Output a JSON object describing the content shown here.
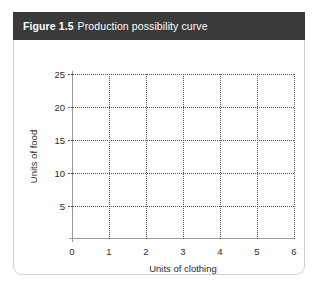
{
  "figure": {
    "caption_number": "Figure 1.5",
    "caption_text": "Production possibility curve",
    "header_color": "#3a3a3a",
    "header_text_color": "#ffffff",
    "card_border_color": "#d2d2d2"
  },
  "chart_data": {
    "type": "line",
    "title": "Production possibility curve",
    "xlabel": "Units of clothing",
    "ylabel": "Units of food",
    "xlim": [
      0,
      6
    ],
    "ylim": [
      0,
      25
    ],
    "x_ticks": [
      "0",
      "1",
      "2",
      "3",
      "4",
      "5",
      "6"
    ],
    "x_tick_values": [
      0,
      1,
      2,
      3,
      4,
      5,
      6
    ],
    "y_ticks": [
      "5",
      "10",
      "15",
      "20",
      "25"
    ],
    "y_tick_values": [
      5,
      10,
      15,
      20,
      25
    ],
    "grid": true,
    "grid_style": "dotted",
    "grid_color": "#555555",
    "axis_color": "#9a9a9a",
    "legend": null,
    "series": [],
    "annotations": [],
    "note": "Empty grid: axes and gridlines only, no data plotted"
  }
}
